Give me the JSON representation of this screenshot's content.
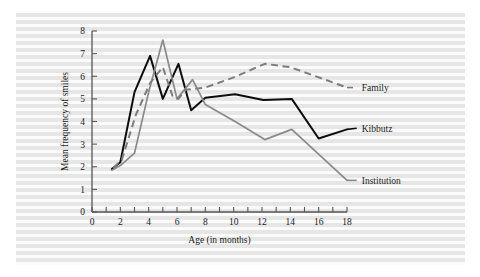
{
  "figure": {
    "background_color": "#f2f2f2",
    "page_color": "#ffffff"
  },
  "chart_data": {
    "type": "line",
    "title": "",
    "xlabel": "Age (in months)",
    "ylabel": "Mean frequency of smiles",
    "xlim": [
      0,
      18
    ],
    "ylim": [
      0,
      8
    ],
    "x_ticks": [
      0,
      1,
      2,
      3,
      4,
      5,
      6,
      7,
      8,
      9,
      10,
      11,
      12,
      13,
      14,
      15,
      16,
      17,
      18
    ],
    "x_tick_labels": [
      "0",
      "",
      "2",
      "",
      "4",
      "",
      "6",
      "",
      "8",
      "",
      "10",
      "",
      "12",
      "",
      "14",
      "",
      "16",
      "",
      "18"
    ],
    "y_ticks": [
      0,
      1,
      2,
      3,
      4,
      5,
      6,
      7,
      8
    ],
    "y_tick_labels": [
      "0",
      "1",
      "2",
      "3",
      "4",
      "5",
      "6",
      "7",
      "8"
    ],
    "grid": false,
    "legend_position": "right-inline-labels",
    "series": [
      {
        "name": "Kibbutz",
        "color": "#0d0d0d",
        "style": "solid",
        "label_x": 18.9,
        "label_y": 3.7,
        "x": [
          1.4,
          2.0,
          3.0,
          4.1,
          5.0,
          6.1,
          7.0,
          8.0,
          10.1,
          12.1,
          14.1,
          16.0,
          18.0
        ],
        "y": [
          1.9,
          2.2,
          5.3,
          6.9,
          5.0,
          6.55,
          4.5,
          5.05,
          5.2,
          4.95,
          5.0,
          3.25,
          3.65
        ]
      },
      {
        "name": "Institution",
        "color": "#8a8a8a",
        "style": "solid",
        "label_x": 18.9,
        "label_y": 1.4,
        "x": [
          1.4,
          2.0,
          3.0,
          4.0,
          5.0,
          6.0,
          7.1,
          8.0,
          10.1,
          12.2,
          14.1,
          18.0
        ],
        "y": [
          1.85,
          2.05,
          2.6,
          5.3,
          7.6,
          5.0,
          5.85,
          4.75,
          4.0,
          3.2,
          3.65,
          1.4
        ]
      },
      {
        "name": "Family",
        "color": "#7d7d7d",
        "style": "dashed",
        "label_x": 18.9,
        "label_y": 5.5,
        "x": [
          1.5,
          2.1,
          3.1,
          4.1,
          5.0,
          5.7,
          6.1,
          6.6,
          8.0,
          10.0,
          12.2,
          14.0,
          18.0
        ],
        "y": [
          1.95,
          2.3,
          4.3,
          5.7,
          6.4,
          5.1,
          5.0,
          5.4,
          5.5,
          5.95,
          6.55,
          6.4,
          5.5
        ]
      }
    ]
  }
}
